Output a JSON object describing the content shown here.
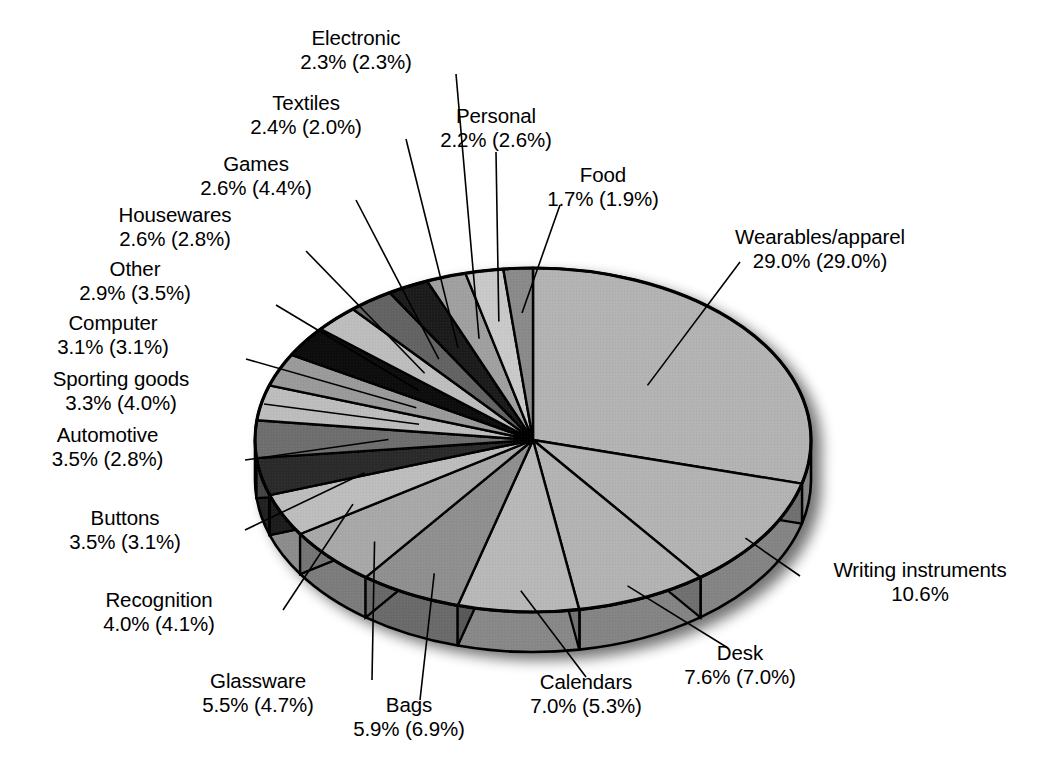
{
  "chart_data": {
    "type": "pie",
    "title": "",
    "subtitle": "",
    "xlabel": "",
    "ylabel": "",
    "legend": "none",
    "grid": false,
    "value_format": "primary% (secondary%)",
    "note": "Each slice shows a primary percentage and, in parentheses, a second-series percentage. Writing instruments shows only a primary percentage.",
    "categories": [
      "Wearables/apparel",
      "Writing instruments",
      "Desk",
      "Calendars",
      "Bags",
      "Glassware",
      "Recognition",
      "Buttons",
      "Automotive",
      "Sporting goods",
      "Computer",
      "Other",
      "Housewares",
      "Games",
      "Textiles",
      "Electronic",
      "Personal",
      "Food"
    ],
    "series": [
      {
        "name": "primary",
        "values": [
          29.0,
          10.6,
          7.6,
          7.0,
          5.9,
          5.5,
          4.0,
          3.5,
          3.5,
          3.3,
          3.1,
          2.9,
          2.6,
          2.6,
          2.4,
          2.3,
          2.2,
          1.7
        ]
      },
      {
        "name": "secondary",
        "values": [
          29.0,
          null,
          7.0,
          5.3,
          6.9,
          4.7,
          4.1,
          3.1,
          2.8,
          4.0,
          3.1,
          3.5,
          2.8,
          4.4,
          2.0,
          2.3,
          2.6,
          1.9
        ]
      }
    ],
    "slices": [
      {
        "id": "wearables",
        "name": "Wearables/apparel",
        "value": 29.0,
        "value_text": "29.0% (29.0%)",
        "fill": "#b3b3b3"
      },
      {
        "id": "writing",
        "name": "Writing instruments",
        "value": 10.6,
        "value_text": "10.6%",
        "fill": "#b3b3b3"
      },
      {
        "id": "desk",
        "name": "Desk",
        "value": 7.6,
        "value_text": "7.6% (7.0%)",
        "fill": "#b3b3b3"
      },
      {
        "id": "calendars",
        "name": "Calendars",
        "value": 7.0,
        "value_text": "7.0% (5.3%)",
        "fill": "#b8b8b8"
      },
      {
        "id": "bags",
        "name": "Bags",
        "value": 5.9,
        "value_text": "5.9% (6.9%)",
        "fill": "#8f8f8f"
      },
      {
        "id": "glassware",
        "name": "Glassware",
        "value": 5.5,
        "value_text": "5.5% (4.7%)",
        "fill": "#a8a8a8"
      },
      {
        "id": "recognition",
        "name": "Recognition",
        "value": 4.0,
        "value_text": "4.0% (4.1%)",
        "fill": "#bdbdbd"
      },
      {
        "id": "buttons",
        "name": "Buttons",
        "value": 3.5,
        "value_text": "3.5% (3.1%)",
        "fill": "#2b2b2b"
      },
      {
        "id": "automotive",
        "name": "Automotive",
        "value": 3.5,
        "value_text": "3.5% (2.8%)",
        "fill": "#6e6e6e"
      },
      {
        "id": "sporting",
        "name": "Sporting goods",
        "value": 3.3,
        "value_text": "3.3% (4.0%)",
        "fill": "#bdbdbd"
      },
      {
        "id": "computer",
        "name": "Computer",
        "value": 3.1,
        "value_text": "3.1% (3.1%)",
        "fill": "#9a9a9a"
      },
      {
        "id": "other",
        "name": "Other",
        "value": 2.9,
        "value_text": "2.9% (3.5%)",
        "fill": "#0d0d0d"
      },
      {
        "id": "housewares",
        "name": "Housewares",
        "value": 2.6,
        "value_text": "2.6% (2.8%)",
        "fill": "#bdbdbd"
      },
      {
        "id": "games",
        "name": "Games",
        "value": 2.6,
        "value_text": "2.6% (4.4%)",
        "fill": "#636363"
      },
      {
        "id": "textiles",
        "name": "Textiles",
        "value": 2.4,
        "value_text": "2.4% (2.0%)",
        "fill": "#1a1a1a"
      },
      {
        "id": "electronic",
        "name": "Electronic",
        "value": 2.3,
        "value_text": "2.3% (2.3%)",
        "fill": "#a0a0a0"
      },
      {
        "id": "personal",
        "name": "Personal",
        "value": 2.2,
        "value_text": "2.2% (2.6%)",
        "fill": "#c9c9c9"
      },
      {
        "id": "food",
        "name": "Food",
        "value": 1.7,
        "value_text": "1.7% (1.9%)",
        "fill": "#8a8a8a"
      }
    ]
  },
  "labels": [
    {
      "id": "electronic",
      "name": "Electronic",
      "value": "2.3% (2.3%)"
    },
    {
      "id": "textiles",
      "name": "Textiles",
      "value": "2.4% (2.0%)"
    },
    {
      "id": "games",
      "name": "Games",
      "value": "2.6% (4.4%)"
    },
    {
      "id": "housewares",
      "name": "Housewares",
      "value": "2.6% (2.8%)"
    },
    {
      "id": "other",
      "name": "Other",
      "value": "2.9% (3.5%)"
    },
    {
      "id": "computer",
      "name": "Computer",
      "value": "3.1% (3.1%)"
    },
    {
      "id": "sporting",
      "name": "Sporting goods",
      "value": "3.3% (4.0%)"
    },
    {
      "id": "automotive",
      "name": "Automotive",
      "value": "3.5% (2.8%)"
    },
    {
      "id": "buttons",
      "name": "Buttons",
      "value": "3.5% (3.1%)"
    },
    {
      "id": "recognition",
      "name": "Recognition",
      "value": "4.0% (4.1%)"
    },
    {
      "id": "glassware",
      "name": "Glassware",
      "value": "5.5% (4.7%)"
    },
    {
      "id": "bags",
      "name": "Bags",
      "value": "5.9% (6.9%)"
    },
    {
      "id": "calendars",
      "name": "Calendars",
      "value": "7.0% (5.3%)"
    },
    {
      "id": "desk",
      "name": "Desk",
      "value": "7.6% (7.0%)"
    },
    {
      "id": "writing",
      "name": "Writing instruments",
      "value": "10.6%"
    },
    {
      "id": "wearables",
      "name": "Wearables/apparel",
      "value": "29.0% (29.0%)"
    },
    {
      "id": "personal",
      "name": "Personal",
      "value": "2.2% (2.6%)"
    },
    {
      "id": "food",
      "name": "Food",
      "value": "1.7% (1.9%)"
    }
  ],
  "colors": {
    "background": "#ffffff",
    "outline": "#000000",
    "text": "#000000",
    "leader_line": "#000000"
  }
}
